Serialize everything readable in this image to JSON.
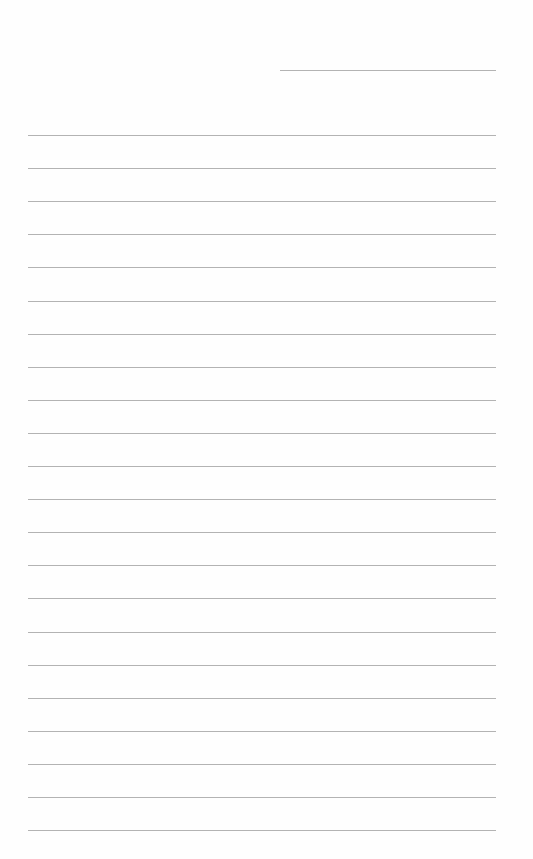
{
  "page": {
    "type": "lined-notepaper",
    "background_color": "#fefefe",
    "line_color": "#b3b3b3",
    "header_line": {
      "top": 70,
      "left": 280,
      "width": 216
    },
    "rules": {
      "count": 22,
      "first_top": 135,
      "spacing": 33.1,
      "left": 28,
      "width": 468
    }
  }
}
